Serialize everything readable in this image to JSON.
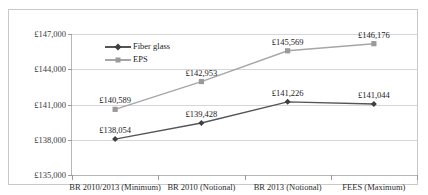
{
  "chart_data": {
    "type": "line",
    "title": "",
    "xlabel": "",
    "ylabel": "",
    "grid": true,
    "legend_position": "upper-left-inside",
    "categories": [
      "BR 2010/2013 (Minimum)",
      "BR 2010 (Notional)",
      "BR 2013 (Notional)",
      "FEES (Maximum)"
    ],
    "ylim": [
      135000,
      147000
    ],
    "ytick_values": [
      135000,
      138000,
      141000,
      144000,
      147000
    ],
    "ytick_labels": [
      "£135,000",
      "£138,000",
      "£141,000",
      "£144,000",
      "£147,000"
    ],
    "series": [
      {
        "name": "Fiber glass",
        "color": "#555555",
        "marker": "diamond",
        "values": [
          138054,
          139428,
          141226,
          141044
        ],
        "point_labels": [
          "£138,054",
          "£139,428",
          "£141,226",
          "£141,044"
        ]
      },
      {
        "name": "EPS",
        "color": "#a6a6a6",
        "marker": "square",
        "values": [
          140589,
          142953,
          145569,
          146176
        ],
        "point_labels": [
          "£140,589",
          "£142,953",
          "£145,569",
          "£146,176"
        ]
      }
    ]
  },
  "legend": {
    "entries": [
      {
        "label": "Fiber glass"
      },
      {
        "label": "EPS"
      }
    ]
  },
  "colors": {
    "fiber_glass": "#555555",
    "eps": "#a6a6a6",
    "grid": "#d6d6d6",
    "axis": "#b6b6b6",
    "frame": "#c9c9c9"
  }
}
